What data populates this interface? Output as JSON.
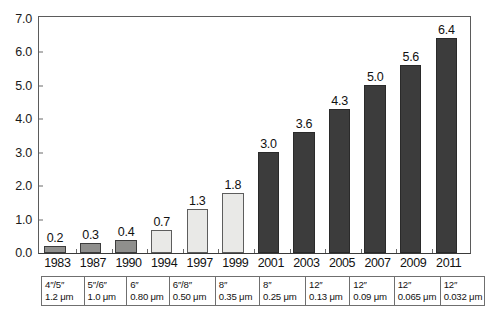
{
  "chart_data": {
    "type": "bar",
    "title": "",
    "subtitle": "",
    "xlabel": "",
    "ylabel": "",
    "ylim": [
      0.0,
      7.0
    ],
    "ytick_labels": [
      "0.0",
      "1.0",
      "2.0",
      "3.0",
      "4.0",
      "5.0",
      "6.0",
      "7.0"
    ],
    "ytick_values": [
      0.0,
      1.0,
      2.0,
      3.0,
      4.0,
      5.0,
      6.0,
      7.0
    ],
    "grid": false,
    "legend": "none",
    "categories": [
      "1983",
      "1987",
      "1990",
      "1994",
      "1997",
      "1999",
      "2001",
      "2003",
      "2005",
      "2007",
      "2009",
      "2011"
    ],
    "values": [
      0.2,
      0.3,
      0.4,
      0.7,
      1.3,
      1.8,
      3.0,
      3.6,
      4.3,
      5.0,
      5.6,
      6.4
    ],
    "value_labels": [
      "0.2",
      "0.3",
      "0.4",
      "0.7",
      "1.3",
      "1.8",
      "3.0",
      "3.6",
      "4.3",
      "5.0",
      "5.6",
      "6.4"
    ],
    "bar_styles": [
      "mid",
      "mid",
      "mid",
      "light",
      "light",
      "light",
      "dark",
      "dark",
      "dark",
      "dark",
      "dark",
      "dark"
    ],
    "colors": {
      "light_fill": "#e9e9e7",
      "mid_fill": "#8f8f8d",
      "dark_fill": "#3c3c3c",
      "bar_stroke": "#3c3c3c",
      "axis": "#5b5b5b",
      "text": "#111111",
      "table_border": "#6f6f6f"
    },
    "spec_table": {
      "row_wafer_size": [
        "4″/5″",
        "5″/6″",
        "6″",
        "6″/8″",
        "8″",
        "8″",
        "12″",
        "12″",
        "12″",
        "12″",
        "12″"
      ],
      "row_feature_size": [
        "1.2 μm",
        "1.0 μm",
        "0.80 μm",
        "0.50 μm",
        "0.35 μm",
        "0.25 μm",
        "0.13 μm",
        "0.09 μm",
        "0.065 μm",
        "0.032 μm"
      ]
    },
    "table_cells": [
      {
        "wafer": "4″/5″",
        "feature": "1.2 μm"
      },
      {
        "wafer": "5″/6″",
        "feature": "1.0 μm"
      },
      {
        "wafer": "6″",
        "feature": "0.80 μm"
      },
      {
        "wafer": "6″/8″",
        "feature": "0.50 μm"
      },
      {
        "wafer": "8″",
        "feature": "0.35 μm"
      },
      {
        "wafer": "8″",
        "feature": "0.25 μm"
      },
      {
        "wafer": "12″",
        "feature": "0.13 μm"
      },
      {
        "wafer": "12″",
        "feature": "0.09 μm"
      },
      {
        "wafer": "12″",
        "feature": "0.065 μm"
      },
      {
        "wafer": "12″",
        "feature": "0.032 μm"
      }
    ]
  }
}
